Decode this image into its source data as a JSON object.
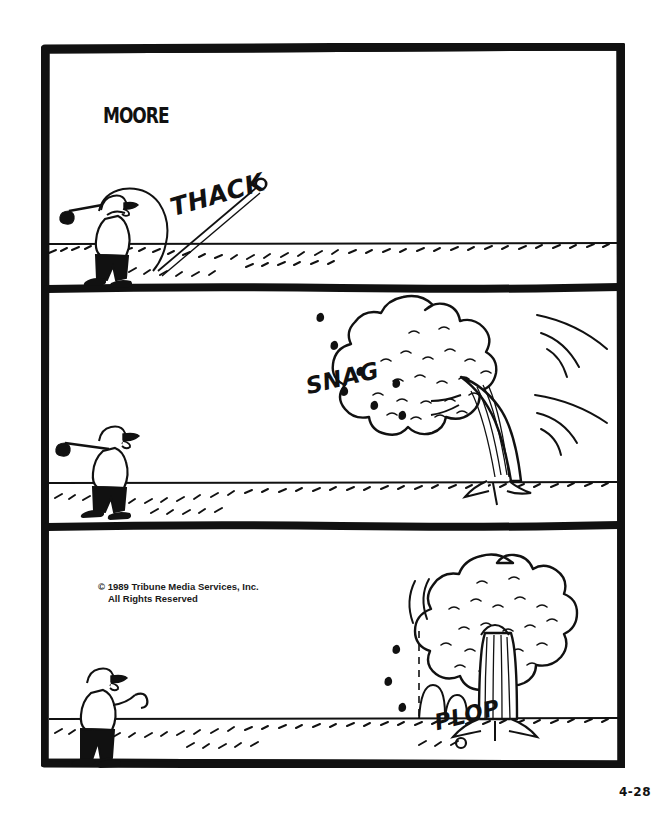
{
  "comic": {
    "artist_signature": "MOORE",
    "date_stamp": "4-28",
    "copyright_line1": "© 1989 Tribune Media Services, Inc.",
    "copyright_line2": "All Rights Reserved",
    "ink_color": "#111111",
    "paper_color": "#ffffff",
    "panels": [
      {
        "index": 1,
        "sfx": "THACK",
        "description": "Golfer swings club, ball flies off to the right toward a round leafy tree on the horizon."
      },
      {
        "index": 2,
        "sfx": "SNAG",
        "description": "Ball strikes the tree, tree bends left with motion lines, leaves scatter; golfer watches from left."
      },
      {
        "index": 3,
        "sfx": "PLOP",
        "description": "Tree springs back upright, ball drops straight down and bounces on the fairway; golfer stands watching."
      }
    ]
  }
}
